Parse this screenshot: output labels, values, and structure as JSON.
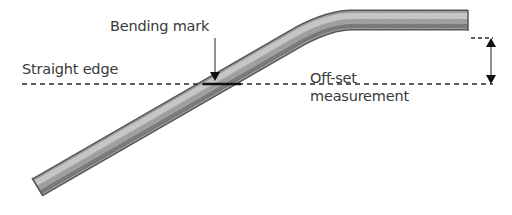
{
  "diagram": {
    "labels": {
      "bending_mark": "Bending mark",
      "straight_edge": "Straight edge",
      "offset_line1": "Off-set",
      "offset_line2": "measurement"
    },
    "colors": {
      "text": "#3a3a3a",
      "pipe_dark": "#5a5a5a",
      "pipe_mid": "#9a9a9a",
      "pipe_light": "#d8d8d8",
      "line": "#2a2a2a"
    }
  }
}
